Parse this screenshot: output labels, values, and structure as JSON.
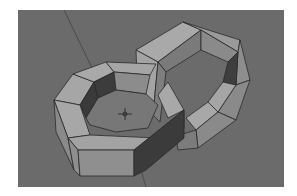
{
  "scene": {
    "description": "3D viewport render of two interlocking octagonal chain rings",
    "background_color": "#6b6b6b",
    "face_light": "#a8a8a8",
    "face_mid": "#8c8c8c",
    "face_dark": "#3a3a3a",
    "edge_color": "#2a2a2a",
    "objects": [
      {
        "name": "octagonal-ring-front-left"
      },
      {
        "name": "octagonal-ring-back-right"
      }
    ],
    "cursor": {
      "name": "3d-cursor"
    }
  }
}
